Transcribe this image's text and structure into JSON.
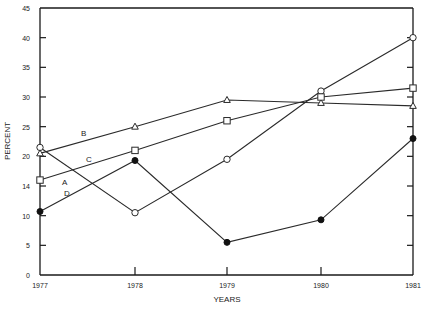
{
  "chart_data": {
    "type": "line",
    "title": "",
    "xlabel": "YEARS",
    "ylabel": "PERCENT",
    "x": [
      "1977",
      "1978",
      "1979",
      "1980",
      "1981"
    ],
    "ylim": [
      0,
      45
    ],
    "y_ticks": [
      0,
      5,
      10,
      15,
      20,
      25,
      30,
      35,
      40,
      45
    ],
    "y_tick_labels": [
      "0",
      "5",
      "10",
      "14",
      "20",
      "25",
      "30",
      "35",
      "40",
      "45"
    ],
    "grid": false,
    "legend": "inline labels",
    "series": [
      {
        "name": "A",
        "marker": "open-circle",
        "values": [
          21.5,
          10.5,
          19.5,
          31,
          40
        ]
      },
      {
        "name": "B",
        "marker": "open-triangle",
        "values": [
          20.5,
          25,
          29.5,
          29,
          28.5
        ]
      },
      {
        "name": "C",
        "marker": "open-square",
        "values": [
          16,
          21,
          26,
          30,
          31.5
        ]
      },
      {
        "name": "D",
        "marker": "filled-circle",
        "values": [
          10.7,
          19.3,
          5.5,
          9.3,
          23
        ]
      }
    ],
    "series_label_positions": {
      "A": {
        "x": 62,
        "y": 185
      },
      "B": {
        "x": 81,
        "y": 136
      },
      "C": {
        "x": 86,
        "y": 162
      },
      "D": {
        "x": 64,
        "y": 196
      }
    }
  },
  "colors": {
    "line": "#2a2a2a",
    "axis": "#1a1a1a",
    "background": "#ffffff"
  }
}
